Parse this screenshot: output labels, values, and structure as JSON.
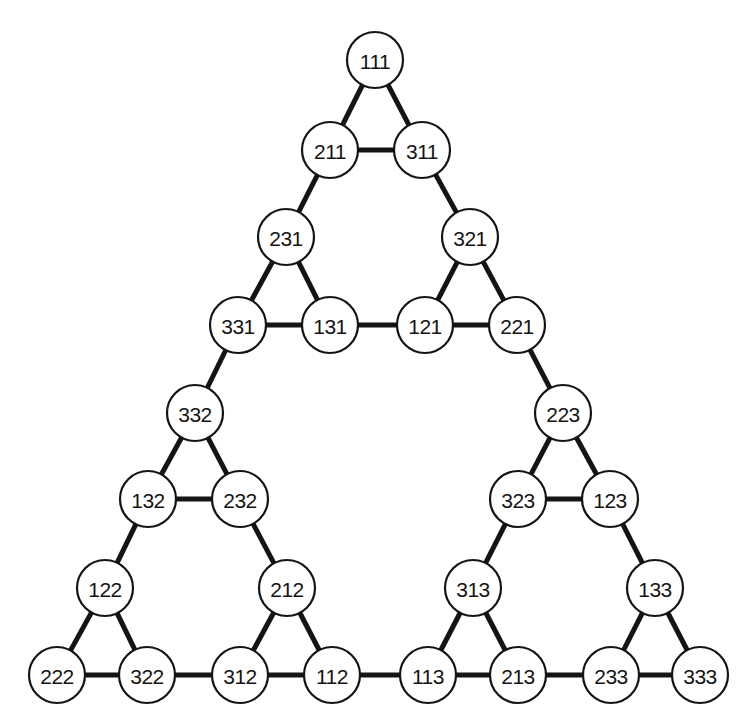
{
  "figure": {
    "background_color": "#ffffff",
    "node_fill_color": "#ffffff",
    "node_stroke_color": "#141414",
    "edge_color": "#141414",
    "label_color": "#141414",
    "node_radius": 28,
    "edge_width": 5,
    "node_stroke_width": 2.2,
    "width": 755,
    "height": 726
  },
  "chart_data": {
    "type": "diagram",
    "xlabel": "",
    "ylabel": "",
    "nodes": [
      {
        "id": "111",
        "label": "111",
        "x": 375,
        "y": 60
      },
      {
        "id": "211",
        "label": "211",
        "x": 330,
        "y": 150
      },
      {
        "id": "311",
        "label": "311",
        "x": 422,
        "y": 150
      },
      {
        "id": "231",
        "label": "231",
        "x": 286,
        "y": 237
      },
      {
        "id": "321",
        "label": "321",
        "x": 470,
        "y": 237
      },
      {
        "id": "331",
        "label": "331",
        "x": 238,
        "y": 325
      },
      {
        "id": "131",
        "label": "131",
        "x": 330,
        "y": 325
      },
      {
        "id": "121",
        "label": "121",
        "x": 425,
        "y": 325
      },
      {
        "id": "221",
        "label": "221",
        "x": 517,
        "y": 325
      },
      {
        "id": "332",
        "label": "332",
        "x": 195,
        "y": 413
      },
      {
        "id": "223",
        "label": "223",
        "x": 563,
        "y": 413
      },
      {
        "id": "132",
        "label": "132",
        "x": 148,
        "y": 499
      },
      {
        "id": "232",
        "label": "232",
        "x": 240,
        "y": 499
      },
      {
        "id": "323",
        "label": "323",
        "x": 518,
        "y": 499
      },
      {
        "id": "123",
        "label": "123",
        "x": 610,
        "y": 499
      },
      {
        "id": "122",
        "label": "122",
        "x": 105,
        "y": 588
      },
      {
        "id": "212",
        "label": "212",
        "x": 287,
        "y": 588
      },
      {
        "id": "313",
        "label": "313",
        "x": 473,
        "y": 588
      },
      {
        "id": "133",
        "label": "133",
        "x": 655,
        "y": 588
      },
      {
        "id": "222",
        "label": "222",
        "x": 57,
        "y": 675
      },
      {
        "id": "322",
        "label": "322",
        "x": 147,
        "y": 675
      },
      {
        "id": "312",
        "label": "312",
        "x": 240,
        "y": 675
      },
      {
        "id": "112",
        "label": "112",
        "x": 332,
        "y": 675
      },
      {
        "id": "113",
        "label": "113",
        "x": 428,
        "y": 675
      },
      {
        "id": "213",
        "label": "213",
        "x": 518,
        "y": 675
      },
      {
        "id": "233",
        "label": "233",
        "x": 611,
        "y": 675
      },
      {
        "id": "333",
        "label": "333",
        "x": 700,
        "y": 675
      }
    ],
    "edges": [
      [
        "111",
        "211"
      ],
      [
        "111",
        "311"
      ],
      [
        "211",
        "311"
      ],
      [
        "211",
        "231"
      ],
      [
        "311",
        "321"
      ],
      [
        "231",
        "331"
      ],
      [
        "231",
        "131"
      ],
      [
        "331",
        "131"
      ],
      [
        "321",
        "121"
      ],
      [
        "321",
        "221"
      ],
      [
        "121",
        "221"
      ],
      [
        "131",
        "121"
      ],
      [
        "331",
        "332"
      ],
      [
        "221",
        "223"
      ],
      [
        "332",
        "132"
      ],
      [
        "332",
        "232"
      ],
      [
        "132",
        "232"
      ],
      [
        "223",
        "323"
      ],
      [
        "223",
        "123"
      ],
      [
        "323",
        "123"
      ],
      [
        "132",
        "122"
      ],
      [
        "232",
        "212"
      ],
      [
        "323",
        "313"
      ],
      [
        "123",
        "133"
      ],
      [
        "122",
        "222"
      ],
      [
        "122",
        "322"
      ],
      [
        "222",
        "322"
      ],
      [
        "212",
        "312"
      ],
      [
        "212",
        "112"
      ],
      [
        "312",
        "112"
      ],
      [
        "322",
        "312"
      ],
      [
        "313",
        "113"
      ],
      [
        "313",
        "213"
      ],
      [
        "113",
        "213"
      ],
      [
        "133",
        "233"
      ],
      [
        "133",
        "333"
      ],
      [
        "233",
        "333"
      ],
      [
        "112",
        "113"
      ],
      [
        "213",
        "233"
      ]
    ]
  }
}
